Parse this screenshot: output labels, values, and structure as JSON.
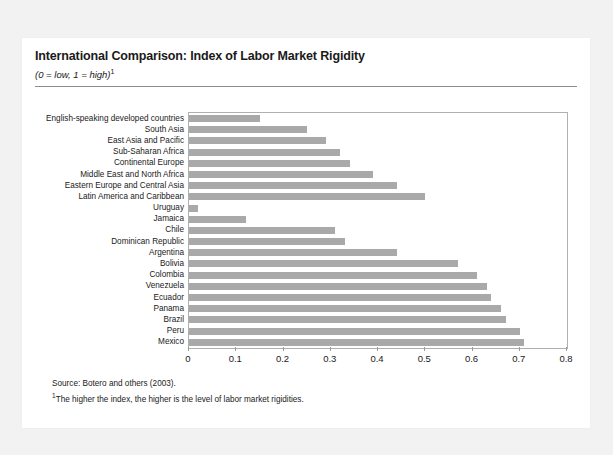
{
  "figure": {
    "title": "International Comparison: Index of Labor Market Rigidity",
    "subtitle": "(0 = low, 1  = high)",
    "subtitle_footnote_mark": "1",
    "source_note": "Source: Botero and others (2003).",
    "footnote_mark": "1",
    "footnote_text": "The higher the index, the higher is the level of labor market rigidities.",
    "bar_color": "#a9a9a9",
    "frame_color": "#b0b0b0",
    "panel_background": "#ffffff",
    "page_background": "#f2f2f2"
  },
  "chart_data": {
    "type": "bar",
    "orientation": "horizontal",
    "title": "International Comparison: Index of Labor Market Rigidity",
    "subtitle": "(0 = low, 1  = high)",
    "xlabel": "",
    "ylabel": "",
    "xlim": [
      0,
      0.8
    ],
    "xticks": [
      "0",
      "0.1",
      "0.2",
      "0.3",
      "0.4",
      "0.5",
      "0.6",
      "0.7",
      "0.8"
    ],
    "xtick_values": [
      0,
      0.1,
      0.2,
      0.3,
      0.4,
      0.5,
      0.6,
      0.7,
      0.8
    ],
    "grid": false,
    "legend": false,
    "categories": [
      "English-speaking developed countries",
      "South Asia",
      "East Asia and Pacific",
      "Sub-Saharan Africa",
      "Continental Europe",
      "Middle East and North Africa",
      "Eastern Europe and Central Asia",
      "Latin America and Caribbean",
      "Uruguay",
      "Jamaica",
      "Chile",
      "Dominican Republic",
      "Argentina",
      "Bolivia",
      "Colombia",
      "Venezuela",
      "Ecuador",
      "Panama",
      "Brazil",
      "Peru",
      "Mexico"
    ],
    "values": [
      0.15,
      0.25,
      0.29,
      0.32,
      0.34,
      0.39,
      0.44,
      0.5,
      0.02,
      0.12,
      0.31,
      0.33,
      0.44,
      0.57,
      0.61,
      0.63,
      0.64,
      0.66,
      0.67,
      0.7,
      0.71
    ]
  }
}
